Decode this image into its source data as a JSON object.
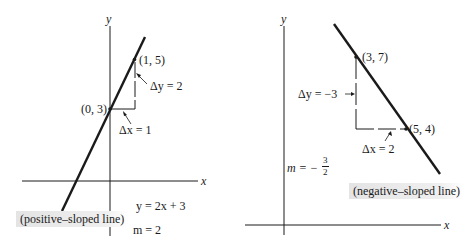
{
  "left_panel": {
    "axis_x_label": "x",
    "axis_y_label": "y",
    "point_a": "(0, 3)",
    "point_b": "(1, 5)",
    "delta_y": "Δy = 2",
    "delta_x": "Δx = 1",
    "equation": "y = 2x + 3",
    "slope": "m = 2",
    "caption": "(positive–sloped line)"
  },
  "right_panel": {
    "axis_x_label": "x",
    "axis_y_label": "y",
    "point_a": "(3, 7)",
    "point_b": "(5, 4)",
    "delta_y": "Δy = −3",
    "delta_x": "Δx = 2",
    "slope_prefix": "m = −",
    "slope_num": "3",
    "slope_den": "2",
    "caption": "(negative–sloped line)"
  },
  "colors": {
    "ink": "#1a1a1a",
    "caption_bg": "#e4e4e4",
    "background": "#ffffff"
  }
}
